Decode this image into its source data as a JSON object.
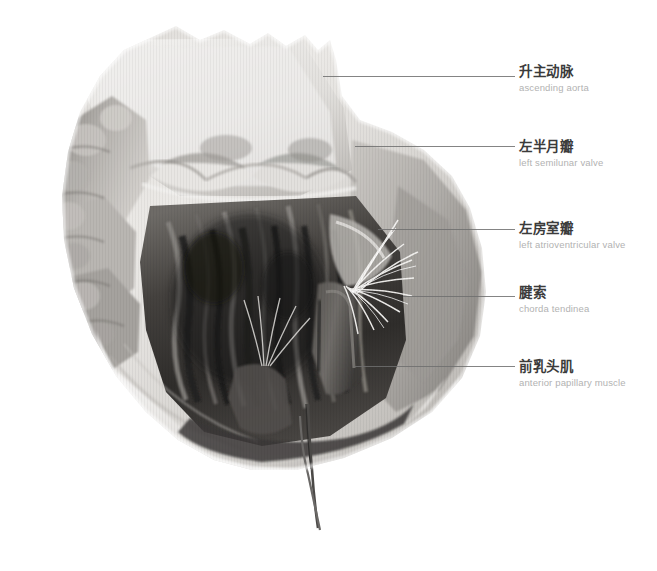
{
  "figure": {
    "kind": "anatomical-specimen-photograph",
    "palette": {
      "background": "#ffffff",
      "tissue_light": "#e9e7e4",
      "tissue_mid": "#9a9793",
      "tissue_dark": "#4a4846",
      "tissue_deep": "#2c2b2a",
      "chordae_white": "#f4f3f1",
      "leader_line": "#6e6e6e",
      "label_cn": "#3b3b3b",
      "label_en": "#b2b2b2"
    }
  },
  "annotations": [
    {
      "id": "ascending-aorta",
      "cn": "升主动脉",
      "en": "ascending aorta",
      "label_top": 64,
      "line_top": 76,
      "line_left": 323,
      "line_width": 192
    },
    {
      "id": "left-semilunar-valve",
      "cn": "左半月瓣",
      "en": "left semilunar valve",
      "label_top": 139,
      "line_top": 146,
      "line_left": 355,
      "line_width": 160
    },
    {
      "id": "left-atrioventricular-valve",
      "cn": "左房室瓣",
      "en": "left atrioventricular valve",
      "label_top": 221,
      "line_top": 229,
      "line_left": 378,
      "line_width": 137
    },
    {
      "id": "chorda-tendinea",
      "cn": "腱索",
      "en": "chorda tendinea",
      "label_top": 285,
      "line_top": 296,
      "line_left": 403,
      "line_width": 112
    },
    {
      "id": "anterior-papillary-muscle",
      "cn": "前乳头肌",
      "en": "anterior papillary muscle",
      "label_top": 359,
      "line_top": 366,
      "line_left": 355,
      "line_width": 160
    }
  ]
}
